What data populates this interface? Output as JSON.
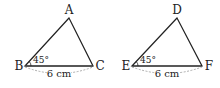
{
  "figure": {
    "triangles": [
      {
        "name": "ABC",
        "vertices": {
          "top": "A",
          "left": "B",
          "right": "C"
        },
        "angle_label": "45°",
        "base_length": "6 cm"
      },
      {
        "name": "DEF",
        "vertices": {
          "top": "D",
          "left": "E",
          "right": "F"
        },
        "angle_label": "45°",
        "base_length": "6 cm"
      }
    ]
  }
}
